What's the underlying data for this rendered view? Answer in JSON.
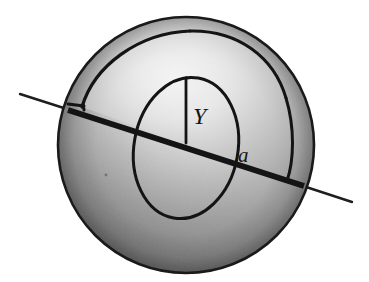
{
  "figure": {
    "name": "sphere-with-spherical-cap-wedge",
    "background_color": "#ffffff",
    "ink_color": "#151515"
  },
  "labels": {
    "radius": "a",
    "height": "Y"
  },
  "sphere": {
    "center_x": 186,
    "center_y": 145,
    "radius": 128,
    "outline_color": "#1a1a1a",
    "highlight_color": "#f2f2f2",
    "midtone_color": "#b4b4b4",
    "shadow_color": "#6f6f6f"
  },
  "axis": {
    "name": "rotation-axis",
    "start_x": 20,
    "start_y": 94,
    "end_x": 352,
    "end_y": 202,
    "inner_thickness": 6,
    "outer_thickness": 2.2
  },
  "inner_circle": {
    "name": "inner-tilted-circle",
    "center_x": 186,
    "center_y": 148,
    "rx": 52,
    "ry": 71,
    "rotation_deg": 10
  },
  "cap": {
    "name": "spherical-cap-wedge",
    "corner_x": 82,
    "corner_y": 107
  }
}
